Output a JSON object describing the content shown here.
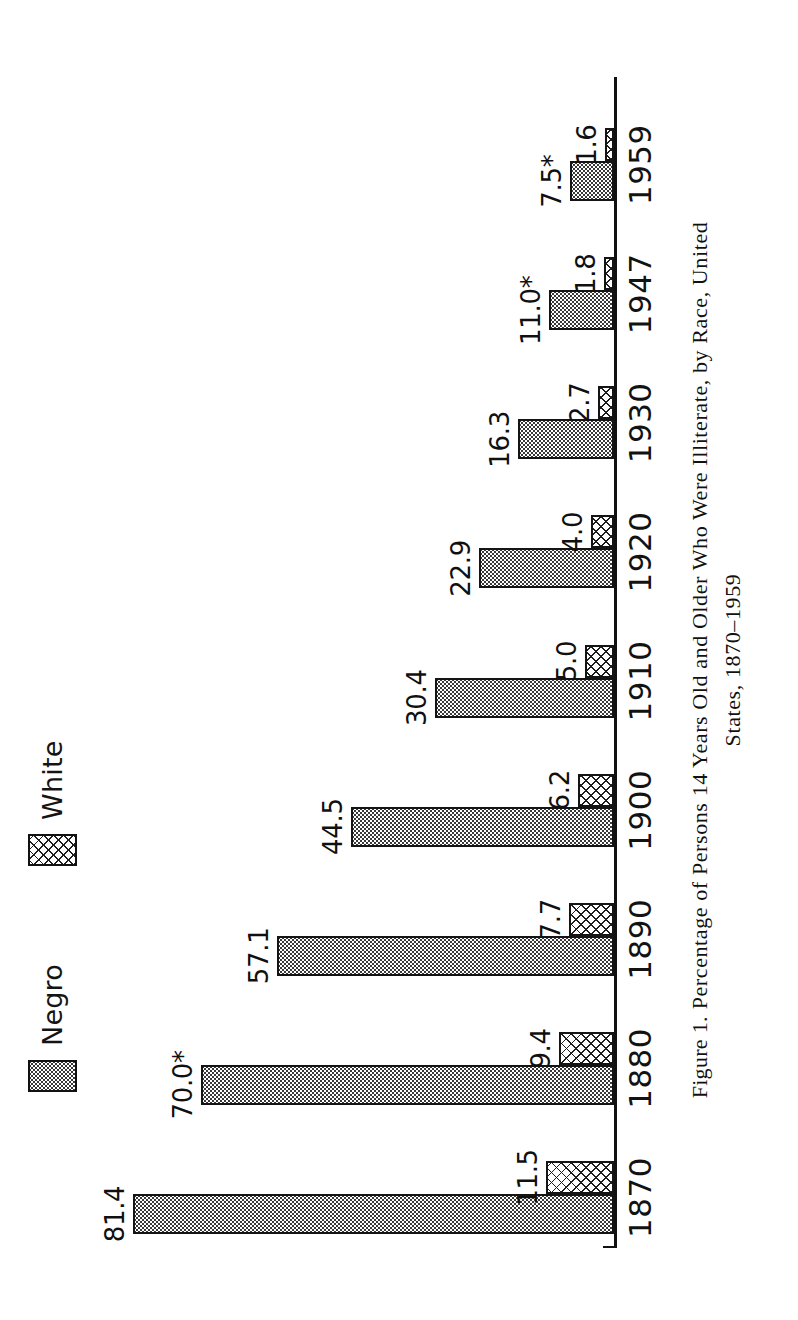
{
  "figure": {
    "caption_line1": "Figure 1. Percentage of Persons 14 Years Old and Older Who Were Illiterate, by Race, United",
    "caption_line2": "States, 1870–1959",
    "caption_label": "Figure 1.",
    "caption_rest_line1": "Percentage of Persons 14 Years Old and Older Who Were Illiterate, by Race, United",
    "footnote_marker": "*"
  },
  "legend": {
    "entries": [
      {
        "label": "Negro",
        "pattern": "stipple",
        "swatch_name": "legend-swatch-negro"
      },
      {
        "label": "White",
        "pattern": "crosshatch",
        "swatch_name": "legend-swatch-white"
      }
    ]
  },
  "chart_data": {
    "type": "bar",
    "title": "Percentage of Persons 14 Years Old and Older Who Were Illiterate, by Race, United States, 1870–1959",
    "xlabel": "",
    "ylabel": "",
    "orientation": "vertical",
    "grid": false,
    "legend_position": "top-left",
    "ylim": [
      0,
      85
    ],
    "categories": [
      "1870",
      "1880",
      "1890",
      "1900",
      "1910",
      "1920",
      "1930",
      "1947",
      "1959"
    ],
    "series": [
      {
        "name": "Negro",
        "values": [
          81.4,
          70.0,
          57.1,
          44.5,
          30.4,
          22.9,
          16.3,
          11.0,
          7.5
        ],
        "labels": [
          "81.4",
          "70.0*",
          "57.1",
          "44.5",
          "30.4",
          "22.9",
          "16.3",
          "11.0*",
          "7.5*"
        ]
      },
      {
        "name": "White",
        "values": [
          11.5,
          9.4,
          7.7,
          6.2,
          5.0,
          4.0,
          2.7,
          1.8,
          1.6
        ],
        "labels": [
          "11.5",
          "9.4",
          "7.7",
          "6.2",
          "5.0",
          "4.0",
          "2.7",
          "1.8",
          "1.6"
        ]
      }
    ]
  },
  "colors": {
    "ink": "#141414",
    "paper": "#ffffff"
  }
}
